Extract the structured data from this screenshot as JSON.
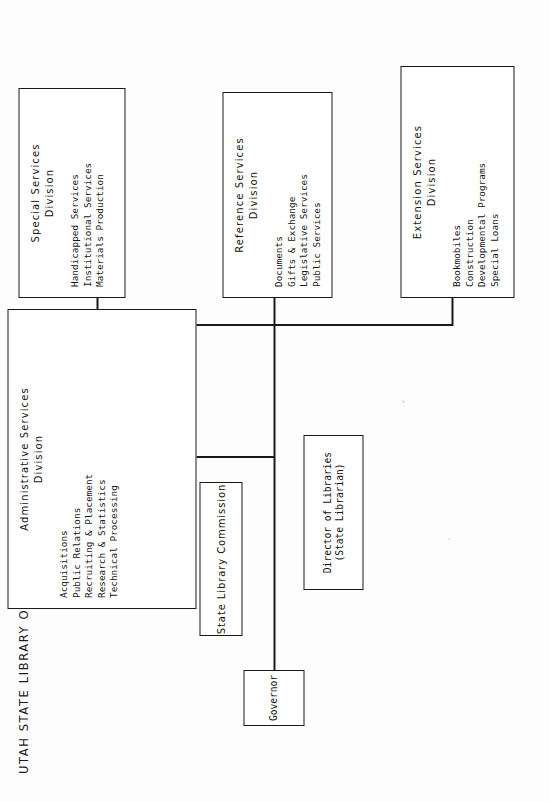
{
  "document": {
    "title": "UTAH STATE LIBRARY ORGANIZATION CHART",
    "type": "organization-chart",
    "orientation": "landscape-rotated-90-ccw",
    "page_width": 549,
    "page_height": 802,
    "ink_color": "#1a1a1a",
    "paper_color": "#fdfdfd"
  },
  "nodes": {
    "governor": {
      "label": "Governor"
    },
    "commission": {
      "label": "State Library Commission"
    },
    "director": {
      "line1": "Director of Libraries",
      "line2": "(State Librarian)"
    },
    "administrative": {
      "head_line1": "Administrative Services",
      "head_line2": "Division",
      "items": [
        "Acquisitions",
        "Public Relations",
        "Recruiting & Placement",
        "Research & Statistics",
        "Technical Processing"
      ]
    },
    "special": {
      "head_line1": "Special Services",
      "head_line2": "Division",
      "items": [
        "Handicapped Services",
        "Institutional Services",
        "Materials Production"
      ]
    },
    "reference": {
      "head_line1": "Reference Services",
      "head_line2": "Division",
      "items": [
        "Documents",
        "Gifts & Exchange",
        "Legislative Services",
        "Public Services"
      ]
    },
    "extension": {
      "head_line1": "Extension Services",
      "head_line2": "Division",
      "items": [
        "Bookmobiles",
        "Construction",
        "Developmental Programs",
        "Special Loans"
      ]
    }
  }
}
